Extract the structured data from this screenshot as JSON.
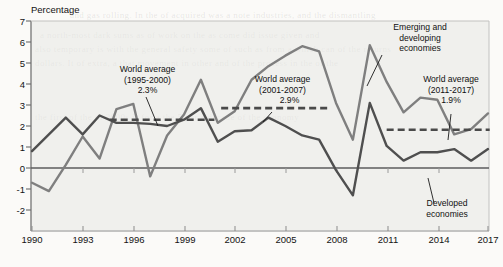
{
  "figure": {
    "y_axis_title": "Percentage",
    "background_note": "scanned book page"
  },
  "axes": {
    "y_ticks": [
      "7",
      "6",
      "5",
      "4",
      "3",
      "2",
      "1",
      "0",
      "-1",
      "-2"
    ],
    "x_ticks": [
      "1990",
      "1993",
      "1996",
      "1999",
      "2002",
      "2005",
      "2008",
      "2011",
      "2014",
      "2017"
    ]
  },
  "annotations": {
    "avg1": {
      "line1": "World average",
      "line2": "(1995-2000)",
      "line3": "2.3%"
    },
    "avg2": {
      "line1": "World average",
      "line2": "(2001-2007)",
      "line3": "2.9%"
    },
    "avg3": {
      "line1": "World average",
      "line2": "(2011-2017)",
      "line3": "1.9%"
    },
    "emerging": {
      "line1": "Emerging and",
      "line2": "developing",
      "line3": "economies"
    },
    "developed": {
      "line1": "Developed",
      "line2": "economies"
    }
  },
  "chart_data": {
    "type": "line",
    "title": "",
    "subtitle": "",
    "xlabel": "",
    "ylabel": "Percentage",
    "xlim": [
      1990,
      2017
    ],
    "ylim": [
      -2,
      7
    ],
    "grid": false,
    "legend": "inline-annotations",
    "x": [
      1990,
      1991,
      1992,
      1993,
      1994,
      1995,
      1996,
      1997,
      1998,
      1999,
      2000,
      2001,
      2002,
      2003,
      2004,
      2005,
      2006,
      2007,
      2008,
      2009,
      2010,
      2011,
      2012,
      2013,
      2014,
      2015,
      2016,
      2017
    ],
    "series": [
      {
        "name": "Developed economies",
        "color": "#4f4f4f",
        "values": [
          0.8,
          1.6,
          2.4,
          1.6,
          2.5,
          2.15,
          2.15,
          2.1,
          2.0,
          2.3,
          2.85,
          1.25,
          1.75,
          1.8,
          2.4,
          2.0,
          1.55,
          1.35,
          -0.1,
          -1.3,
          3.1,
          1.05,
          0.35,
          0.75,
          0.75,
          0.9,
          0.35,
          0.9
        ]
      },
      {
        "name": "Emerging and developing economies",
        "color": "#7f7f7f",
        "values": [
          -0.7,
          -1.1,
          0.15,
          1.5,
          0.45,
          2.8,
          3.05,
          -0.4,
          1.55,
          2.55,
          4.2,
          2.15,
          2.7,
          4.2,
          4.85,
          5.35,
          5.8,
          5.55,
          3.1,
          1.35,
          5.85,
          4.1,
          2.65,
          3.35,
          3.25,
          1.6,
          1.85,
          2.6
        ]
      }
    ],
    "reference_lines": [
      {
        "name": "World average (1995-2000)",
        "value": 2.3,
        "x_start": 1994.6,
        "x_end": 2000.8,
        "style": "dashed",
        "color": "#4a4a4a",
        "label": "2.3%"
      },
      {
        "name": "World average (2001-2007)",
        "value": 2.85,
        "x_start": 2001.2,
        "x_end": 2007.5,
        "style": "dashed",
        "color": "#4a4a4a",
        "label": "2.9%"
      },
      {
        "name": "World average (2011-2017)",
        "value": 1.82,
        "x_start": 2011.0,
        "x_end": 2017.1,
        "style": "dashed",
        "color": "#4a4a4a",
        "label": "1.9%"
      }
    ]
  },
  "bleed_text": {
    "l1": "and gas rolling. In the of acquired was a note industries, and the dismantling",
    "l2": "a north-most dark sums as of work on the as come did issue given and",
    "l3": "also temporary is with the general safety some of such as from a which can of the returns",
    "l4": "dollars.    It of extra, a that movement in other and of the process in the of the",
    "l5": "the first of the of 2000s  is for a the 5 per a decade of the economy"
  }
}
